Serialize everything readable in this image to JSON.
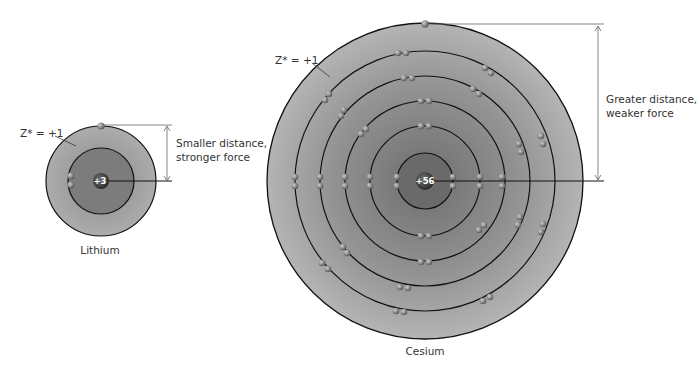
{
  "lithium": {
    "name": "Lithium",
    "nucleus_charge": "+3",
    "zeff_label": "Z* = +1",
    "annotation_line1": "Smaller distance,",
    "annotation_line2": "stronger force",
    "center": [
      101,
      181
    ],
    "outer_radius": 55,
    "inner_radius": 33
  },
  "cesium": {
    "name": "Cesium",
    "nucleus_charge": "+56",
    "zeff_label": "Z* = +1",
    "annotation_line1": "Greater distance,",
    "annotation_line2": "weaker force",
    "center": [
      425,
      181
    ],
    "outer_radius": 158,
    "ring_radii": [
      28,
      55,
      80,
      105,
      130
    ]
  },
  "colors": {
    "outer_shell": "#a9a9a9",
    "inner_shell": "#7f7f7f",
    "ring_line": "#111111",
    "electron": "#8a8a8a",
    "arrow": "#666666"
  }
}
